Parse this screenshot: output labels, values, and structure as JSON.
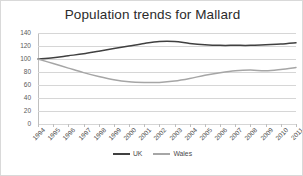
{
  "chart_data": {
    "type": "line",
    "title": "Population trends for Mallard",
    "xlabel": "",
    "ylabel": "",
    "ylim": [
      0,
      140
    ],
    "yticks": [
      0,
      20,
      40,
      60,
      80,
      100,
      120,
      140
    ],
    "grid": true,
    "legend_position": "bottom",
    "categories": [
      "1994",
      "1995",
      "1996",
      "1997",
      "1998",
      "1999",
      "2000",
      "2001",
      "2002",
      "2003",
      "2004",
      "2005",
      "2006",
      "2007",
      "2008",
      "2009",
      "2010",
      "2011"
    ],
    "series": [
      {
        "name": "UK",
        "color": "#404040",
        "values": [
          100,
          102,
          105,
          108,
          112,
          116,
          120,
          124,
          127,
          127,
          124,
          122,
          121,
          121,
          121,
          122,
          123,
          125
        ]
      },
      {
        "name": "Wales",
        "color": "#a6a6a6",
        "values": [
          100,
          93,
          86,
          79,
          73,
          68,
          65,
          64,
          64,
          66,
          70,
          75,
          79,
          82,
          83,
          82,
          84,
          87
        ]
      }
    ]
  },
  "legend": {
    "items": [
      {
        "label": "UK",
        "color": "#404040"
      },
      {
        "label": "Wales",
        "color": "#a6a6a6"
      }
    ]
  }
}
